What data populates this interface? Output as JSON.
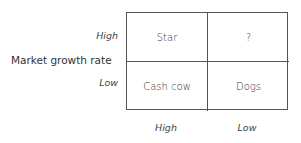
{
  "diagram": {
    "type": "2x2 matrix",
    "y_axis": {
      "title": "Market growth rate",
      "ticks": [
        "High",
        "Low"
      ]
    },
    "x_axis": {
      "ticks": [
        "High",
        "Low"
      ]
    },
    "cells": {
      "top_left": "Star",
      "top_right": "?",
      "bottom_left": "Cash cow",
      "bottom_right": "Dogs"
    },
    "colors": {
      "line": "#555555",
      "text": "#333333",
      "background": "#ffffff"
    }
  }
}
